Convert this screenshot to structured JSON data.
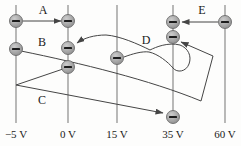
{
  "diagram": {
    "type": "equipotential-work-diagram",
    "charge_sign": "negative",
    "colors": {
      "background": "#fdfdfc",
      "equipotential_line": "#9b9b9b",
      "path_stroke": "#454545",
      "charge_fill": "#ababab",
      "charge_fill_light": "#cccccc",
      "charge_fill_dark": "#8d8d8d",
      "charge_border": "#6b6b6b",
      "minus_sign": "#1c1c1c",
      "label_text": "#1a1a1a"
    },
    "layout": {
      "line_top": 5,
      "line_bottom": 123,
      "voltage_label_baseline": 138,
      "charge_radius": 6.5
    },
    "equipotentials": [
      {
        "label": "−5 V",
        "voltage": -5,
        "x": 16
      },
      {
        "label": "0 V",
        "voltage": 0,
        "x": 68
      },
      {
        "label": "15 V",
        "voltage": 15,
        "x": 117
      },
      {
        "label": "35 V",
        "voltage": 35,
        "x": 173
      },
      {
        "label": "60 V",
        "voltage": 60,
        "x": 225
      }
    ],
    "charges": [
      {
        "x": 16,
        "y": 21,
        "line": "-5 V"
      },
      {
        "x": 16,
        "y": 49,
        "line": "-5 V"
      },
      {
        "x": 68,
        "y": 21,
        "line": "0 V"
      },
      {
        "x": 68,
        "y": 48,
        "line": "0 V"
      },
      {
        "x": 68,
        "y": 67,
        "line": "0 V"
      },
      {
        "x": 117,
        "y": 58,
        "line": "15 V"
      },
      {
        "x": 173,
        "y": 22,
        "line": "35 V"
      },
      {
        "x": 173,
        "y": 37,
        "line": "35 V"
      },
      {
        "x": 173,
        "y": 117,
        "line": "35 V"
      },
      {
        "x": 225,
        "y": 22,
        "line": "60 V"
      }
    ],
    "paths": [
      {
        "label": "A",
        "from_v": "-5 V",
        "to_v": "0 V",
        "d": "M 23 21 L 61 21",
        "label_x": 43,
        "label_y": 14
      },
      {
        "label": "B",
        "from_v": "-5 V",
        "to_v": "35 V",
        "d": "M 21 51 C 80 63, 150 80, 201 101 L 213 56 L 181 42",
        "label_x": 42,
        "label_y": 46
      },
      {
        "label": "C",
        "from_v": "0 V",
        "to_v": "35 V",
        "d": "M 63 69 L 16 85 L 163 113",
        "label_x": 42,
        "label_y": 104
      },
      {
        "label": "D",
        "from_v": "15 V",
        "to_v": "0 V",
        "d": "M 124 57 C 132 54, 142 51, 149 52 C 158 54, 168 62, 173 68 C 177 73, 186 72, 189 64 C 192 56, 188 48, 180 45 C 168 42, 156 47, 150 50 C 138 44, 120 36, 106 35 C 94 35, 84 38, 77 43",
        "label_x": 146,
        "label_y": 44
      },
      {
        "label": "E",
        "from_v": "60 V",
        "to_v": "35 V",
        "d": "M 218 22 L 182 22",
        "label_x": 202,
        "label_y": 14
      }
    ]
  }
}
